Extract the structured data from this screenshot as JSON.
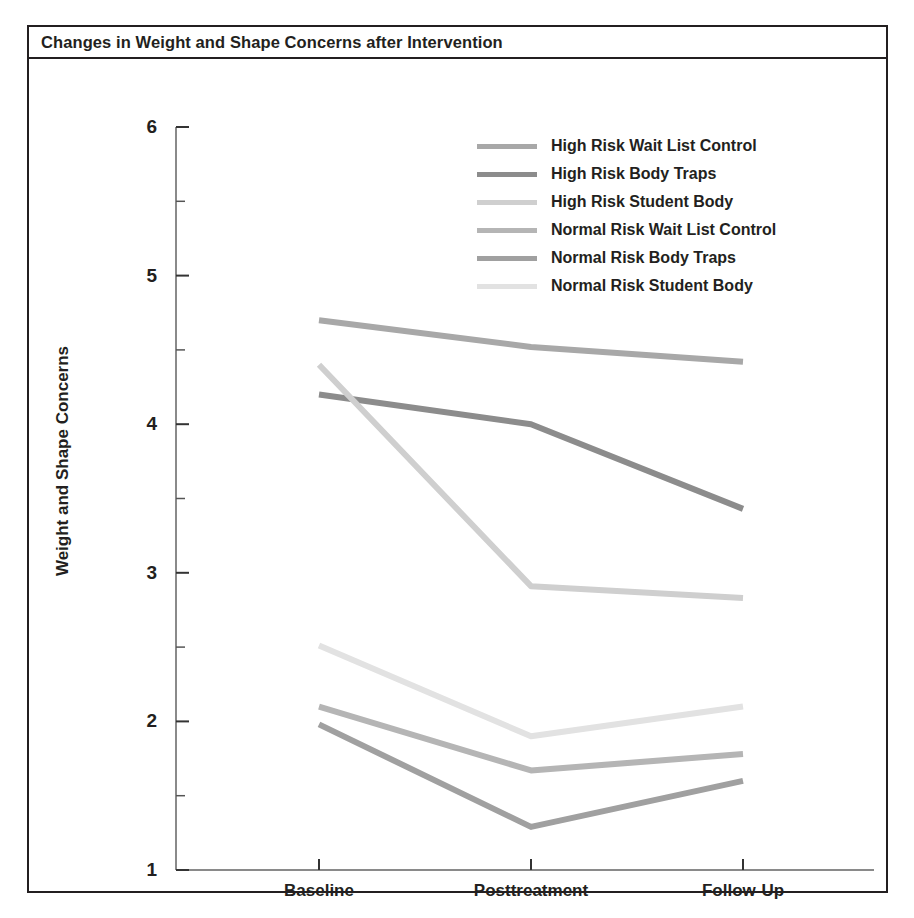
{
  "figure": {
    "title": "Changes in Weight and Shape Concerns after Intervention"
  },
  "axes": {
    "ylabel": "Weight and Shape Concerns",
    "xlabel": "",
    "y_ticks": [
      "6",
      "5",
      "4",
      "3",
      "2",
      "1"
    ],
    "x_ticks": [
      "Baseline",
      "Posttreatment",
      "Follow-Up"
    ]
  },
  "legend": {
    "position": "top-right-inside",
    "entries": [
      {
        "label": "High Risk Wait List Control",
        "color": "#a8a8a8"
      },
      {
        "label": "High Risk Body Traps",
        "color": "#8c8c8c"
      },
      {
        "label": "High Risk Student Body",
        "color": "#cfcfcf"
      },
      {
        "label": "Normal Risk Wait List Control",
        "color": "#b5b5b5"
      },
      {
        "label": "Normal Risk Body Traps",
        "color": "#a0a0a0"
      },
      {
        "label": "Normal Risk Student Body",
        "color": "#e2e2e2"
      }
    ]
  },
  "chart_data": {
    "type": "line",
    "title": "Changes in Weight and Shape Concerns after Intervention",
    "xlabel": "",
    "ylabel": "Weight and Shape Concerns",
    "categories": [
      "Baseline",
      "Posttreatment",
      "Follow-Up"
    ],
    "ylim": [
      1,
      6
    ],
    "ytick_values": [
      1,
      2,
      3,
      4,
      5,
      6
    ],
    "yminor_tick_values": [
      1.5,
      2.5,
      3.5,
      4.5,
      5.5
    ],
    "grid": false,
    "legend_position": "top-right-inside",
    "series": [
      {
        "name": "High Risk Wait List Control",
        "color": "#a8a8a8",
        "values": [
          4.7,
          4.52,
          4.42
        ]
      },
      {
        "name": "High Risk Body Traps",
        "color": "#8c8c8c",
        "values": [
          4.2,
          4.0,
          3.43
        ]
      },
      {
        "name": "High Risk Student Body",
        "color": "#cfcfcf",
        "values": [
          4.4,
          2.91,
          2.83
        ]
      },
      {
        "name": "Normal Risk Wait List Control",
        "color": "#b5b5b5",
        "values": [
          2.1,
          1.67,
          1.78
        ]
      },
      {
        "name": "Normal Risk Body Traps",
        "color": "#a0a0a0",
        "values": [
          1.98,
          1.29,
          1.6
        ]
      },
      {
        "name": "Normal Risk Student Body",
        "color": "#e2e2e2",
        "values": [
          2.51,
          1.9,
          2.1
        ]
      }
    ]
  }
}
